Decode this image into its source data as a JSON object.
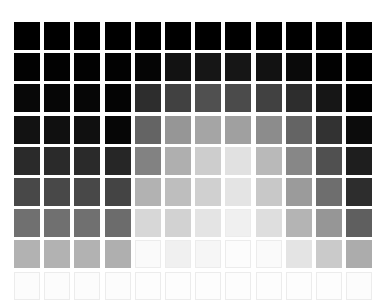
{
  "grid": {
    "rows": 9,
    "cols": 12,
    "origin_x": 14,
    "origin_y": 22,
    "pitch_x": 30.2,
    "pitch_y": 31.2,
    "tile_w": 26,
    "tile_h": 28,
    "gray_values": [
      [
        0,
        0,
        0,
        0,
        0,
        0,
        0,
        0,
        0,
        0,
        0,
        0
      ],
      [
        2,
        2,
        2,
        2,
        5,
        18,
        22,
        22,
        18,
        10,
        2,
        0
      ],
      [
        8,
        6,
        6,
        4,
        45,
        65,
        80,
        75,
        65,
        45,
        22,
        2
      ],
      [
        18,
        16,
        16,
        6,
        100,
        150,
        165,
        160,
        140,
        100,
        50,
        12
      ],
      [
        42,
        42,
        42,
        38,
        130,
        175,
        205,
        225,
        185,
        135,
        80,
        30
      ],
      [
        72,
        72,
        72,
        68,
        178,
        190,
        208,
        228,
        200,
        155,
        110,
        45
      ],
      [
        112,
        112,
        112,
        108,
        215,
        210,
        228,
        240,
        222,
        180,
        150,
        95
      ],
      [
        178,
        178,
        178,
        175,
        250,
        240,
        246,
        252,
        250,
        228,
        202,
        172
      ],
      [
        252,
        252,
        252,
        252,
        253,
        253,
        253,
        253,
        253,
        253,
        253,
        252
      ]
    ]
  }
}
